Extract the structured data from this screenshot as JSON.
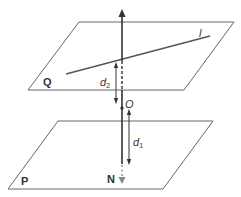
{
  "diagram": {
    "type": "geometry-two-parallel-planes",
    "planes": [
      {
        "id": "Q",
        "label": "Q",
        "corners": [
          [
            79,
            22
          ],
          [
            234,
            22
          ],
          [
            184,
            90
          ],
          [
            28,
            90
          ]
        ]
      },
      {
        "id": "P",
        "label": "P",
        "corners": [
          [
            58,
            121
          ],
          [
            213,
            121
          ],
          [
            163,
            189
          ],
          [
            8,
            189
          ]
        ]
      }
    ],
    "line_l": {
      "label": "l",
      "from": [
        66,
        74
      ],
      "to": [
        210,
        36
      ]
    },
    "perpendicular": {
      "x": 122,
      "top": 10,
      "bottom": 183
    },
    "point_O": {
      "label": "O",
      "x": 122,
      "y": 108
    },
    "point_N": {
      "label": "N",
      "x": 122,
      "y": 182
    },
    "distances": [
      {
        "name": "d2",
        "base": "d",
        "sub": "2",
        "x": 116,
        "y1": 63,
        "y2": 104
      },
      {
        "name": "d1",
        "base": "d",
        "sub": "1",
        "x": 129,
        "y1": 110,
        "y2": 164
      }
    ],
    "colors": {
      "line": "#444444",
      "plane": "#666666",
      "arrow_N": "#888888"
    }
  }
}
